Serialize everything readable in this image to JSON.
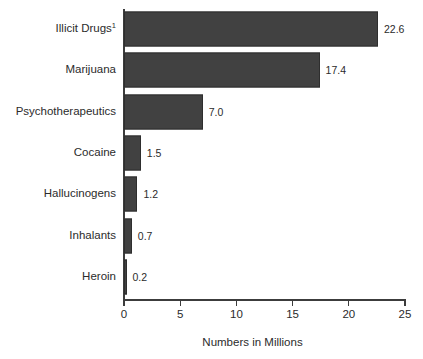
{
  "chart_data": {
    "type": "bar",
    "orientation": "horizontal",
    "title": "",
    "xlabel": "Numbers in Millions",
    "ylabel": "",
    "xlim": [
      0,
      25
    ],
    "xticks": [
      0,
      5,
      10,
      15,
      20,
      25
    ],
    "xtick_labels": [
      "0",
      "5",
      "10",
      "15",
      "20",
      "25"
    ],
    "grid": false,
    "legend": null,
    "bar_color": "#414141",
    "bar_edge_color": "#2e2e2e",
    "axis_color": "#3c3c3c",
    "text_color": "#2b2b2b",
    "background": "#ffffff",
    "categories": [
      "Illicit Drugs",
      "Marijuana",
      "Psychotherapeutics",
      "Cocaine",
      "Hallucinogens",
      "Inhalants",
      "Heroin"
    ],
    "values": [
      22.6,
      17.4,
      7.0,
      1.5,
      1.2,
      0.7,
      0.2
    ],
    "value_labels": [
      "22.6",
      "17.4",
      "7.0",
      "1.5",
      "1.2",
      "0.7",
      "0.2"
    ],
    "footnote_markers": [
      "1",
      "",
      "",
      "",
      "",
      "",
      ""
    ],
    "bars": [
      {
        "category": "Illicit Drugs",
        "footnote": "1",
        "value": 22.6,
        "label": "22.6"
      },
      {
        "category": "Marijuana",
        "footnote": "",
        "value": 17.4,
        "label": "17.4"
      },
      {
        "category": "Psychotherapeutics",
        "footnote": "",
        "value": 7.0,
        "label": "7.0"
      },
      {
        "category": "Cocaine",
        "footnote": "",
        "value": 1.5,
        "label": "1.5"
      },
      {
        "category": "Hallucinogens",
        "footnote": "",
        "value": 1.2,
        "label": "1.2"
      },
      {
        "category": "Inhalants",
        "footnote": "",
        "value": 0.7,
        "label": "0.7"
      },
      {
        "category": "Heroin",
        "footnote": "",
        "value": 0.2,
        "label": "0.2"
      }
    ]
  }
}
